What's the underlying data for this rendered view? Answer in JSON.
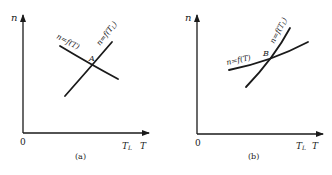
{
  "panels": [
    {
      "id": "a",
      "caption": "(a)",
      "y_axis_label": "n",
      "origin_label": "0",
      "x_axis_label_TL": "T",
      "x_axis_label_TL_sub": "L",
      "x_axis_label_T": "T",
      "curve_motor_label": "n=f(T)",
      "curve_load_label": "n=f(T",
      "curve_load_label_sub": "L",
      "curve_load_label_end": ")",
      "intersection_label": "A"
    },
    {
      "id": "b",
      "caption": "(b)",
      "y_axis_label": "n",
      "origin_label": "0",
      "x_axis_label_TL": "T",
      "x_axis_label_TL_sub": "L",
      "x_axis_label_T": "T",
      "curve_motor_label": "n=f(T)",
      "curve_load_label": "n=f(T",
      "curve_load_label_sub": "L",
      "curve_load_label_end": ")",
      "intersection_label": "B"
    }
  ],
  "colors": {
    "ink": "#1a1a1a",
    "background": "#ffffff"
  }
}
